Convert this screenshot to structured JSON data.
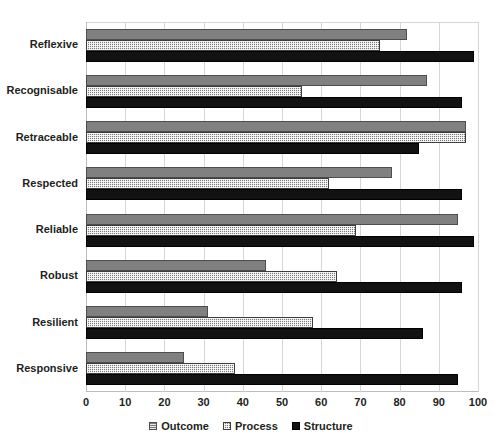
{
  "chart_data": {
    "type": "bar",
    "orientation": "horizontal",
    "title": "",
    "xlabel": "",
    "ylabel": "",
    "xlim": [
      0,
      100
    ],
    "xticks": [
      0,
      10,
      20,
      30,
      40,
      50,
      60,
      70,
      80,
      90,
      100
    ],
    "grid": true,
    "legend_position": "bottom",
    "categories": [
      "Reflexive",
      "Recognisable",
      "Retraceable",
      "Respected",
      "Reliable",
      "Robust",
      "Resilient",
      "Responsive"
    ],
    "series": [
      {
        "name": "Outcome",
        "color": "#808080",
        "values": [
          82,
          87,
          97,
          78,
          95,
          46,
          31,
          25
        ]
      },
      {
        "name": "Process",
        "color": "#7a7a7a",
        "values": [
          75,
          55,
          97,
          62,
          69,
          64,
          58,
          38
        ]
      },
      {
        "name": "Structure",
        "color": "#121212",
        "values": [
          99,
          96,
          85,
          96,
          99,
          96,
          86,
          95
        ]
      }
    ]
  },
  "axis": {
    "tick_labels": [
      "0",
      "10",
      "20",
      "30",
      "40",
      "50",
      "60",
      "70",
      "80",
      "90",
      "100"
    ]
  },
  "legend": {
    "items": [
      {
        "label": "Outcome",
        "swatch": "outcome-swatch-icon"
      },
      {
        "label": "Process",
        "swatch": "process-swatch-icon"
      },
      {
        "label": "Structure",
        "swatch": "structure-swatch-icon"
      }
    ]
  }
}
